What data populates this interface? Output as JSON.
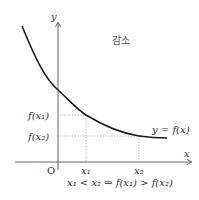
{
  "diagram": {
    "title": "감소",
    "axes": {
      "x_label": "x",
      "y_label": "y",
      "origin_label": "O"
    },
    "curve": {
      "label": "y = f(x)",
      "type": "decreasing",
      "color": "#1a1a1a"
    },
    "points": [
      {
        "x_label": "x₁",
        "y_label": "f(x₁)"
      },
      {
        "x_label": "x₂",
        "y_label": "f(x₂)"
      }
    ],
    "caption": "x₁ < x₂ ⇒ f(x₁) > f(x₂)",
    "guide_color": "#9a9a9a",
    "axis_color": "#555555"
  }
}
